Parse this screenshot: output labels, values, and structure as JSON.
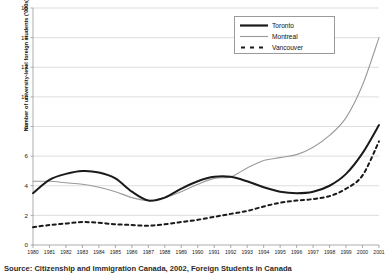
{
  "chart_data": {
    "type": "line",
    "title": "",
    "xlabel": "",
    "ylabel": "Number of university-level foreign students ('000s)",
    "ylim": [
      0,
      16
    ],
    "yticks": [
      0,
      2,
      4,
      6,
      8,
      10,
      12,
      14,
      16
    ],
    "grid": true,
    "legend_position": "top-right",
    "categories": [
      "1980",
      "1981",
      "1982",
      "1983",
      "1984",
      "1985",
      "1986",
      "1987",
      "1988",
      "1989",
      "1990",
      "1991",
      "1992",
      "1993",
      "1994",
      "1995",
      "1996",
      "1997",
      "1998",
      "1999",
      "2000",
      "2001"
    ],
    "series": [
      {
        "name": "Toronto",
        "color": "#1a1a1a",
        "style": "solid-thick",
        "values": [
          3.5,
          4.4,
          4.8,
          5.0,
          4.9,
          4.5,
          3.6,
          3.0,
          3.2,
          3.8,
          4.3,
          4.6,
          4.6,
          4.3,
          3.9,
          3.6,
          3.5,
          3.6,
          4.0,
          4.8,
          6.2,
          8.1
        ]
      },
      {
        "name": "Montreal",
        "color": "#9a9a9a",
        "style": "solid-thin",
        "values": [
          4.3,
          4.3,
          4.2,
          4.1,
          3.9,
          3.6,
          3.2,
          3.0,
          3.2,
          3.6,
          4.1,
          4.5,
          4.6,
          5.2,
          5.7,
          5.9,
          6.1,
          6.6,
          7.4,
          8.6,
          10.8,
          14.0
        ]
      },
      {
        "name": "Vancouver",
        "color": "#1a1a1a",
        "style": "dashed",
        "values": [
          1.2,
          1.35,
          1.45,
          1.55,
          1.5,
          1.4,
          1.35,
          1.3,
          1.4,
          1.55,
          1.7,
          1.9,
          2.1,
          2.3,
          2.6,
          2.85,
          3.0,
          3.1,
          3.3,
          3.8,
          4.7,
          7.0
        ]
      }
    ]
  },
  "legend": {
    "entries": [
      {
        "label": "Toronto"
      },
      {
        "label": "Montreal"
      },
      {
        "label": "Vancouver"
      }
    ]
  },
  "axis": {
    "y_title": "Number of university-level foreign students ('000s)"
  },
  "caption": {
    "text": "Source: Citizenship and Immigration Canada, 2002, Foreign Students in Canada"
  }
}
